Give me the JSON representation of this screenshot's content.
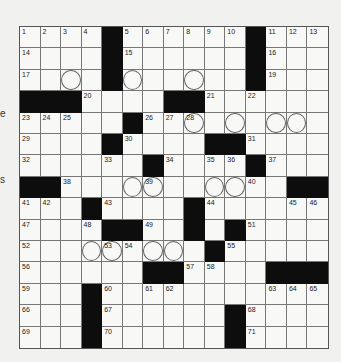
{
  "puzzle": {
    "rows": 15,
    "cols": 15,
    "layout": [
      "....#......#...",
      "....#......#...",
      "....#......#...",
      "###....##......",
      ".....#.........",
      "....#....##....",
      "......#....#...",
      "##...........##",
      "...#....#......",
      "....##..#.#....",
      ".........#.....",
      "......##....###",
      "...#...........",
      "...#......#....",
      "...#......#...."
    ],
    "numbers": [
      {
        "r": 0,
        "c": 0,
        "n": "1"
      },
      {
        "r": 0,
        "c": 1,
        "n": "2"
      },
      {
        "r": 0,
        "c": 2,
        "n": "3"
      },
      {
        "r": 0,
        "c": 3,
        "n": "4"
      },
      {
        "r": 0,
        "c": 5,
        "n": "5"
      },
      {
        "r": 0,
        "c": 6,
        "n": "6"
      },
      {
        "r": 0,
        "c": 7,
        "n": "7"
      },
      {
        "r": 0,
        "c": 8,
        "n": "8"
      },
      {
        "r": 0,
        "c": 9,
        "n": "9"
      },
      {
        "r": 0,
        "c": 10,
        "n": "10"
      },
      {
        "r": 0,
        "c": 12,
        "n": "11"
      },
      {
        "r": 0,
        "c": 13,
        "n": "12"
      },
      {
        "r": 0,
        "c": 14,
        "n": "13"
      },
      {
        "r": 1,
        "c": 0,
        "n": "14"
      },
      {
        "r": 1,
        "c": 5,
        "n": "15"
      },
      {
        "r": 1,
        "c": 12,
        "n": "16"
      },
      {
        "r": 2,
        "c": 0,
        "n": "17"
      },
      {
        "r": 2,
        "c": 4,
        "n": "18"
      },
      {
        "r": 2,
        "c": 12,
        "n": "19"
      },
      {
        "r": 3,
        "c": 3,
        "n": "20"
      },
      {
        "r": 3,
        "c": 9,
        "n": "21"
      },
      {
        "r": 3,
        "c": 11,
        "n": "22"
      },
      {
        "r": 4,
        "c": 0,
        "n": "23"
      },
      {
        "r": 4,
        "c": 1,
        "n": "24"
      },
      {
        "r": 4,
        "c": 2,
        "n": "25"
      },
      {
        "r": 4,
        "c": 6,
        "n": "26"
      },
      {
        "r": 4,
        "c": 7,
        "n": "27"
      },
      {
        "r": 4,
        "c": 8,
        "n": "28"
      },
      {
        "r": 5,
        "c": 0,
        "n": "29"
      },
      {
        "r": 5,
        "c": 5,
        "n": "30"
      },
      {
        "r": 5,
        "c": 11,
        "n": "31"
      },
      {
        "r": 6,
        "c": 0,
        "n": "32"
      },
      {
        "r": 6,
        "c": 4,
        "n": "33"
      },
      {
        "r": 6,
        "c": 7,
        "n": "34"
      },
      {
        "r": 6,
        "c": 9,
        "n": "35"
      },
      {
        "r": 6,
        "c": 10,
        "n": "36"
      },
      {
        "r": 6,
        "c": 12,
        "n": "37"
      },
      {
        "r": 7,
        "c": 2,
        "n": "38"
      },
      {
        "r": 7,
        "c": 6,
        "n": "39"
      },
      {
        "r": 7,
        "c": 11,
        "n": "40"
      },
      {
        "r": 8,
        "c": 0,
        "n": "41"
      },
      {
        "r": 8,
        "c": 1,
        "n": "42"
      },
      {
        "r": 8,
        "c": 4,
        "n": "43"
      },
      {
        "r": 8,
        "c": 9,
        "n": "44"
      },
      {
        "r": 8,
        "c": 13,
        "n": "45"
      },
      {
        "r": 8,
        "c": 14,
        "n": "46"
      },
      {
        "r": 9,
        "c": 0,
        "n": "47"
      },
      {
        "r": 9,
        "c": 3,
        "n": "48"
      },
      {
        "r": 9,
        "c": 6,
        "n": "49"
      },
      {
        "r": 9,
        "c": 8,
        "n": "50"
      },
      {
        "r": 9,
        "c": 11,
        "n": "51"
      },
      {
        "r": 10,
        "c": 0,
        "n": "52"
      },
      {
        "r": 10,
        "c": 4,
        "n": "53"
      },
      {
        "r": 10,
        "c": 5,
        "n": "54"
      },
      {
        "r": 10,
        "c": 10,
        "n": "55"
      },
      {
        "r": 11,
        "c": 0,
        "n": "56"
      },
      {
        "r": 11,
        "c": 8,
        "n": "57"
      },
      {
        "r": 11,
        "c": 9,
        "n": "58"
      },
      {
        "r": 12,
        "c": 0,
        "n": "59"
      },
      {
        "r": 12,
        "c": 4,
        "n": "60"
      },
      {
        "r": 12,
        "c": 6,
        "n": "61"
      },
      {
        "r": 12,
        "c": 7,
        "n": "62"
      },
      {
        "r": 12,
        "c": 12,
        "n": "63"
      },
      {
        "r": 12,
        "c": 13,
        "n": "64"
      },
      {
        "r": 12,
        "c": 14,
        "n": "65"
      },
      {
        "r": 13,
        "c": 0,
        "n": "66"
      },
      {
        "r": 13,
        "c": 4,
        "n": "67"
      },
      {
        "r": 13,
        "c": 11,
        "n": "68"
      },
      {
        "r": 14,
        "c": 0,
        "n": "69"
      },
      {
        "r": 14,
        "c": 4,
        "n": "70"
      },
      {
        "r": 14,
        "c": 11,
        "n": "71"
      }
    ],
    "circles": [
      {
        "r": 2,
        "c": 2
      },
      {
        "r": 2,
        "c": 4
      },
      {
        "r": 2,
        "c": 5
      },
      {
        "r": 2,
        "c": 8
      },
      {
        "r": 4,
        "c": 8
      },
      {
        "r": 4,
        "c": 10
      },
      {
        "r": 4,
        "c": 12
      },
      {
        "r": 4,
        "c": 13
      },
      {
        "r": 7,
        "c": 5
      },
      {
        "r": 7,
        "c": 6
      },
      {
        "r": 7,
        "c": 9
      },
      {
        "r": 7,
        "c": 10
      },
      {
        "r": 10,
        "c": 3
      },
      {
        "r": 10,
        "c": 4
      },
      {
        "r": 10,
        "c": 6
      },
      {
        "r": 10,
        "c": 7
      }
    ]
  },
  "margin_glyphs": [
    {
      "text": "e",
      "top": 108
    },
    {
      "text": "s",
      "top": 174
    }
  ]
}
